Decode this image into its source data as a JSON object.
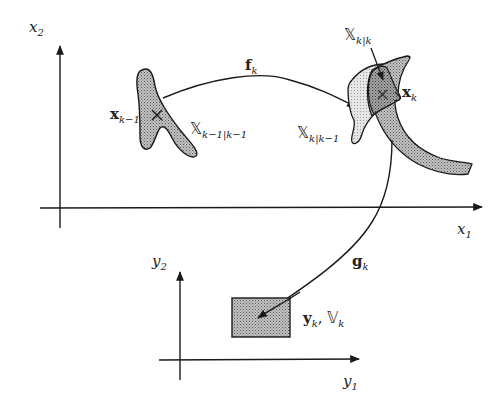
{
  "diagram": {
    "colors": {
      "line": "#1a1a1a",
      "prior_set_fill": "#a0a0a0",
      "predicted_set_fill": "#dcdcdc",
      "posterior_set_fill": "#8c8c8c",
      "measurement_set_fill": "#a8a8a8",
      "background": "#ffffff"
    },
    "state_space": {
      "x_axis_label": {
        "base": "x",
        "sub": "1"
      },
      "y_axis_label": {
        "base": "x",
        "sub": "2"
      }
    },
    "measurement_space": {
      "x_axis_label": {
        "base": "y",
        "sub": "1"
      },
      "y_axis_label": {
        "base": "y",
        "sub": "2"
      }
    },
    "labels": {
      "prev_state": {
        "base": "x",
        "sub": "k−1"
      },
      "prev_set": {
        "base": "𝕏",
        "sub": "k−1|k−1"
      },
      "transition": {
        "base": "f",
        "sub": "k"
      },
      "predicted_set": {
        "base": "𝕏",
        "sub": "k|k−1"
      },
      "posterior_set": {
        "base": "𝕏",
        "sub": "k|k"
      },
      "state": {
        "base": "x",
        "sub": "k"
      },
      "measurement_fn": {
        "base": "g",
        "sub": "k"
      },
      "measurement": {
        "base": "y",
        "sub": "k",
        "sep": ",",
        "set_base": "𝕍",
        "set_sub": "k"
      }
    }
  }
}
